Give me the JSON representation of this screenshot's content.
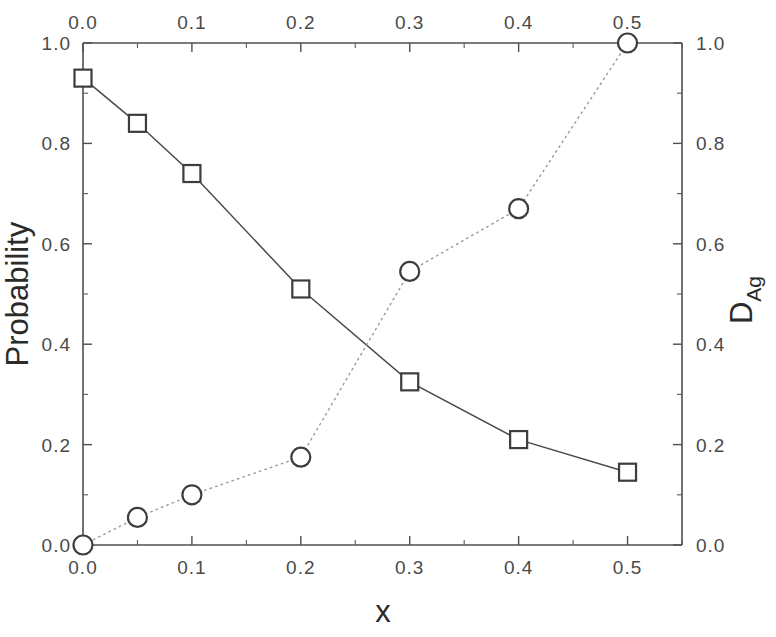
{
  "chart_data": {
    "type": "scatter",
    "title": "",
    "subtitle": "",
    "xlabel": "x",
    "ylabel": "Probability",
    "y2label": "D",
    "y2label_sub": "Ag",
    "xlim": [
      0.0,
      0.55
    ],
    "ylim": [
      0.0,
      1.0
    ],
    "y2lim": [
      0.0,
      1.0
    ],
    "grid": false,
    "legend": "none",
    "x": [
      0.0,
      0.05,
      0.1,
      0.2,
      0.3,
      0.4,
      0.5
    ],
    "series": [
      {
        "name": "Probability",
        "axis": "left",
        "marker": "square",
        "linestyle": "solid",
        "values": [
          0.93,
          0.84,
          0.74,
          0.51,
          0.325,
          0.21,
          0.145
        ]
      },
      {
        "name": "D_Ag",
        "axis": "right",
        "marker": "circle",
        "linestyle": "dotted",
        "values": [
          0.0,
          0.055,
          0.1,
          0.175,
          0.545,
          0.67,
          1.0
        ]
      }
    ],
    "x_ticks": [
      "0.0",
      "0.1",
      "0.2",
      "0.3",
      "0.4",
      "0.5"
    ],
    "x_tick_values": [
      0.0,
      0.1,
      0.2,
      0.3,
      0.4,
      0.5
    ],
    "x_ticks_top": [
      "0.0",
      "0.1",
      "0.2",
      "0.3",
      "0.4",
      "0.5"
    ],
    "y_ticks_left": [
      "0.0",
      "0.2",
      "0.4",
      "0.6",
      "0.8",
      "1.0"
    ],
    "y_tick_values_left": [
      0.0,
      0.2,
      0.4,
      0.6,
      0.8,
      1.0
    ],
    "y_ticks_right": [
      "0.0",
      "0.2",
      "0.4",
      "0.6",
      "0.8",
      "1.0"
    ],
    "y_tick_values_right": [
      0.0,
      0.2,
      0.4,
      0.6,
      0.8,
      1.0
    ],
    "colors": {
      "axis": "#4f4f4f",
      "probability_series": "#4a4a4a",
      "dag_series": "#9a9a9a",
      "marker_fill": "#ffffff",
      "marker_stroke": "#3d3d3d",
      "background": "#ffffff"
    }
  },
  "axes": {
    "x_title": "x",
    "y_left_title": "Probability",
    "y_right_title": "D",
    "y_right_title_sub": "Ag"
  }
}
